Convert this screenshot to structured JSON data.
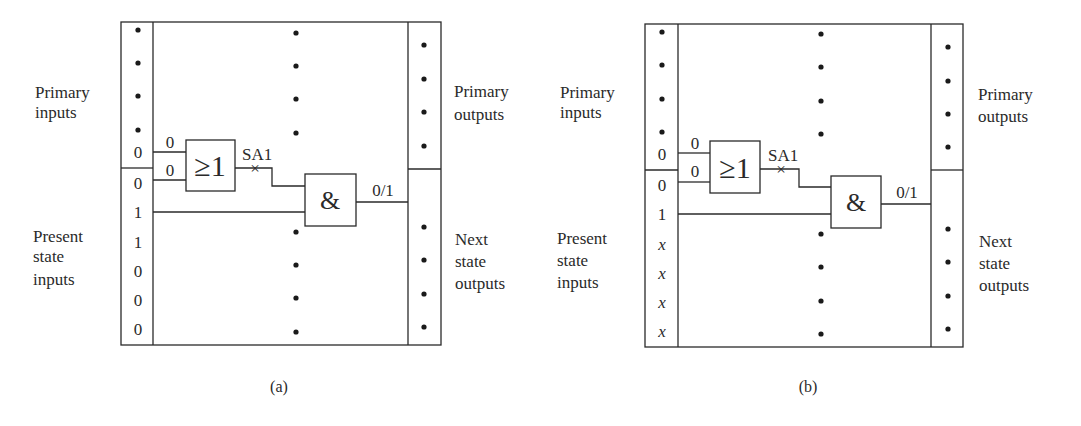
{
  "figure": {
    "panels": [
      {
        "id": "a",
        "caption": "(a)",
        "labels": {
          "primary_inputs": [
            "Primary",
            "inputs"
          ],
          "present_state_inputs": [
            "Present",
            "state",
            "inputs"
          ],
          "primary_outputs": [
            "Primary",
            "outputs"
          ],
          "next_state_outputs": [
            "Next",
            "state",
            "outputs"
          ]
        },
        "primary_input_last_value": "0",
        "present_state_values": [
          "0",
          "1",
          "1",
          "0",
          "0",
          "0"
        ],
        "present_state_italic": false,
        "or_gate": {
          "symbol": "≥1",
          "input_labels": [
            "0",
            "0"
          ]
        },
        "fault_label": "SA1",
        "fault_marker": "×",
        "and_gate": {
          "symbol": "&"
        },
        "and_output_label": "0/1"
      },
      {
        "id": "b",
        "caption": "(b)",
        "labels": {
          "primary_inputs": [
            "Primary",
            "inputs"
          ],
          "present_state_inputs": [
            "Present",
            "state",
            "inputs"
          ],
          "primary_outputs": [
            "Primary",
            "outputs"
          ],
          "next_state_outputs": [
            "Next",
            "state",
            "outputs"
          ]
        },
        "primary_input_last_value": "0",
        "present_state_values": [
          "0",
          "1",
          "x",
          "x",
          "x",
          "x"
        ],
        "present_state_italic": true,
        "or_gate": {
          "symbol": "≥1",
          "input_labels": [
            "0",
            "0"
          ]
        },
        "fault_label": "SA1",
        "fault_marker": "×",
        "and_gate": {
          "symbol": "&"
        },
        "and_output_label": "0/1"
      }
    ]
  }
}
